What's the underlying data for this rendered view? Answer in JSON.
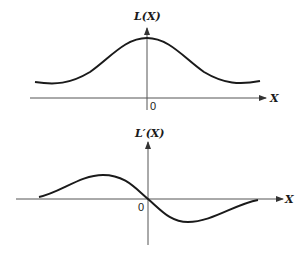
{
  "diagram": {
    "top_plot": {
      "y_label": "L(X)",
      "x_label": "X",
      "origin_label": "0",
      "description": "Bell-shaped curve symmetric about X=0, positive everywhere"
    },
    "bottom_plot": {
      "y_label": "L′(X)",
      "x_label": "X",
      "origin_label": "0",
      "description": "Derivative of bell curve: positive for X<0, zero at origin, negative for X>0"
    },
    "colors": {
      "curve": "#1a1a1a",
      "axis": "#555555",
      "background": "#ffffff"
    }
  }
}
